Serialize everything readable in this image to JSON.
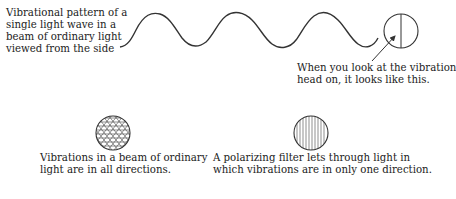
{
  "labels": {
    "side_view": [
      "Vibrational pattern of a",
      "single light wave in a",
      "beam of ordinary light",
      "viewed from the side"
    ],
    "head_on": [
      "When you look at the vibration",
      "head on, it looks like this."
    ],
    "ordinary": [
      "Vibrations in a beam of ordinary",
      "light are in all directions."
    ],
    "polarized": [
      "A polarizing filter lets through light in",
      "which vibrations are in only one direction."
    ]
  },
  "figures": {
    "wave": "sine-wave",
    "head_on_circle": "circle-with-vertical-line",
    "ordinary_circle": "circle-crosshatched",
    "polarized_circle": "circle-vertical-lines"
  },
  "colors": {
    "stroke": "#333333",
    "text": "#222222"
  }
}
